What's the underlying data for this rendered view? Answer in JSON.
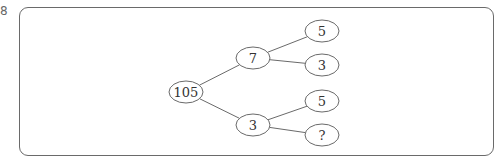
{
  "marker": "8",
  "tree": {
    "root": {
      "label": "105",
      "cx": 186,
      "cy": 92,
      "rx": 17,
      "ry": 11
    },
    "level1": [
      {
        "label": "7",
        "cx": 253,
        "cy": 58,
        "rx": 17,
        "ry": 11
      },
      {
        "label": "3",
        "cx": 253,
        "cy": 125,
        "rx": 17,
        "ry": 11
      }
    ],
    "level2": [
      {
        "label": "5",
        "cx": 322,
        "cy": 31,
        "rx": 17,
        "ry": 11,
        "parent": 0
      },
      {
        "label": "3",
        "cx": 322,
        "cy": 65,
        "rx": 17,
        "ry": 11,
        "parent": 0
      },
      {
        "label": "5",
        "cx": 322,
        "cy": 101,
        "rx": 17,
        "ry": 11,
        "parent": 1
      },
      {
        "label": "?",
        "cx": 322,
        "cy": 135,
        "rx": 17,
        "ry": 11,
        "parent": 1
      }
    ]
  },
  "colors": {
    "stroke": "#6a6a6a",
    "text": "#333333"
  }
}
